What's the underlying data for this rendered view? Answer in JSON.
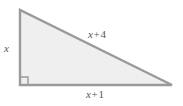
{
  "figure": {
    "type": "right-triangle-diagram",
    "background_color": "#ffffff",
    "fill_color": "#efefef",
    "stroke_color": "#9a9a9c",
    "label_color": "#58585a",
    "labels": {
      "vertical_leg": "x",
      "hypotenuse": "x + 4",
      "base": "x + 1",
      "hypotenuse_variable": "x",
      "hypotenuse_operator": "+",
      "hypotenuse_constant": "4",
      "base_variable": "x",
      "base_operator": "+",
      "base_constant": "1"
    },
    "right_angle_marker": "right-angle-square",
    "vertices": {
      "top": "20,10",
      "bottom_left": "20,85",
      "bottom_right": "172,85"
    }
  }
}
